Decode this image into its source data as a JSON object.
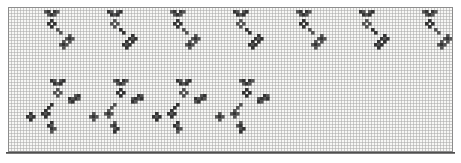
{
  "app": {
    "name": "cross-stitch pattern chart",
    "description": "scanned needlework grid chart with repeating sprig motifs"
  },
  "grid": {
    "cols": 148,
    "rows": 48,
    "cell": 3,
    "origin": {
      "x": 8,
      "y": 7
    },
    "canvas": {
      "width": 461,
      "height": 163
    },
    "colors": {
      "paper": "#ffffff",
      "grid_bg": "#f7f7f5",
      "line": "#a8a8a8",
      "border": "#8c8c8c",
      "baseline": "#4f4f4f",
      "stitch_dark": "#343434",
      "stitch_mid": "#565656"
    }
  },
  "pattern": {
    "repeat_period_cols": 21,
    "motifs": [
      {
        "name": "top-sprig",
        "anchors": [
          [
            12,
            1
          ],
          [
            33,
            1
          ],
          [
            54,
            1
          ],
          [
            75,
            1
          ],
          [
            96,
            1
          ],
          [
            117,
            1
          ],
          [
            138,
            1
          ]
        ],
        "cells": [
          [
            0,
            0
          ],
          [
            1,
            0
          ],
          [
            3,
            0
          ],
          [
            4,
            0
          ],
          [
            1,
            1
          ],
          [
            2,
            1
          ],
          [
            3,
            1
          ],
          [
            2,
            3
          ],
          [
            1,
            4
          ],
          [
            3,
            4
          ],
          [
            2,
            5
          ],
          [
            4,
            6
          ],
          [
            5,
            7
          ],
          [
            8,
            8
          ],
          [
            7,
            9
          ],
          [
            8,
            9
          ],
          [
            9,
            9
          ],
          [
            8,
            10
          ],
          [
            6,
            10
          ],
          [
            5,
            11
          ],
          [
            6,
            11
          ],
          [
            7,
            11
          ],
          [
            6,
            12
          ]
        ]
      },
      {
        "name": "bottom-sprig",
        "anchors": [
          [
            14,
            24
          ],
          [
            35,
            24
          ],
          [
            56,
            24
          ],
          [
            77,
            24
          ]
        ],
        "cells": [
          [
            0,
            0
          ],
          [
            1,
            0
          ],
          [
            3,
            0
          ],
          [
            4,
            0
          ],
          [
            1,
            1
          ],
          [
            2,
            1
          ],
          [
            3,
            1
          ],
          [
            2,
            3
          ],
          [
            1,
            4
          ],
          [
            3,
            4
          ],
          [
            2,
            5
          ],
          [
            8,
            5
          ],
          [
            9,
            5
          ],
          [
            8,
            6
          ],
          [
            9,
            6
          ],
          [
            6,
            6
          ],
          [
            7,
            6
          ],
          [
            6,
            7
          ],
          [
            7,
            7
          ],
          [
            0,
            8
          ],
          [
            -1,
            9
          ],
          [
            -2,
            10
          ],
          [
            -3,
            11
          ],
          [
            -2,
            11
          ],
          [
            -1,
            11
          ],
          [
            -2,
            12
          ],
          [
            -7,
            11
          ],
          [
            -8,
            12
          ],
          [
            -7,
            12
          ],
          [
            -6,
            12
          ],
          [
            -7,
            13
          ],
          [
            0,
            14
          ],
          [
            -1,
            15
          ],
          [
            0,
            15
          ],
          [
            0,
            16
          ],
          [
            1,
            16
          ],
          [
            0,
            17
          ]
        ]
      }
    ]
  }
}
